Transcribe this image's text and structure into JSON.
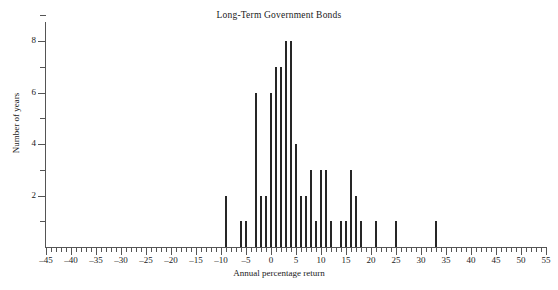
{
  "chart_data": {
    "type": "bar",
    "title": "Long-Term Government Bonds",
    "xlabel": "Annual percentage return",
    "ylabel": "Number of years",
    "xlim": [
      -45,
      55
    ],
    "ylim": [
      0,
      9
    ],
    "xtick_major_step": 5,
    "xtick_minor_step": 1,
    "ytick_major_step": 2,
    "ytick_minor_step": 1,
    "grid": false,
    "legend": null,
    "bar_color": "#262626",
    "axis_color": "#555555",
    "x_major_ticks": [
      -45,
      -40,
      -35,
      -30,
      -25,
      -20,
      -15,
      -10,
      -5,
      0,
      5,
      10,
      15,
      20,
      25,
      30,
      35,
      40,
      45,
      50,
      55
    ],
    "x_major_tick_labels": [
      "–45",
      "–40",
      "–35",
      "–30",
      "–25",
      "–20",
      "–15",
      "–10",
      "–5",
      "0",
      "5",
      "10",
      "15",
      "20",
      "25",
      "30",
      "35",
      "40",
      "45",
      "50",
      "55"
    ],
    "y_major_ticks": [
      2,
      4,
      6,
      8
    ],
    "y_major_tick_labels": [
      "2",
      "4",
      "6",
      "8"
    ],
    "y_minor_ticks": [
      1,
      3,
      5,
      7,
      9
    ],
    "categories": [
      -9,
      -6,
      -5,
      -3,
      -2,
      -1,
      0,
      1,
      2,
      3,
      4,
      5,
      6,
      7,
      8,
      9,
      10,
      11,
      12,
      14,
      15,
      16,
      17,
      18,
      21,
      25,
      33
    ],
    "values": [
      2,
      1,
      1,
      6,
      2,
      2,
      6,
      7,
      7,
      8,
      8,
      4,
      2,
      2,
      3,
      1,
      3,
      3,
      1,
      1,
      1,
      3,
      2,
      1,
      1,
      1,
      1
    ]
  }
}
